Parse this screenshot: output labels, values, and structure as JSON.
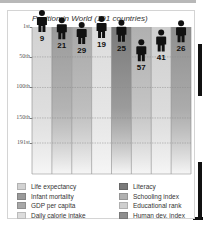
{
  "chart_data": {
    "type": "bar",
    "title": "Position in World (191 countries)",
    "xlabel": "",
    "ylabel": "",
    "y_axis_inverted": true,
    "ylim": [
      1,
      191
    ],
    "yticks": [
      {
        "value": 1,
        "label": "1st"
      },
      {
        "value": 50,
        "label": "50th"
      },
      {
        "value": 100,
        "label": "100th"
      },
      {
        "value": 150,
        "label": "150th"
      },
      {
        "value": 191,
        "label": "191st"
      }
    ],
    "grid": true,
    "legend_placement": "bottom",
    "categories": [
      "Life expectancy",
      "Infant mortality",
      "GDP per capita",
      "Daily calorie intake",
      "Literacy",
      "Schooling index",
      "Educational rank",
      "Human dev. index"
    ],
    "values": [
      9,
      21,
      29,
      19,
      25,
      57,
      41,
      26
    ],
    "colors": [
      "#d2d2d2",
      "#9a9a9a",
      "#a8a8a8",
      "#dcdcdc",
      "#7a7a7a",
      "#b0b0b0",
      "#cfcfcf",
      "#8f8f8f"
    ],
    "marker": "person-icon"
  },
  "legend": {
    "left": [
      "Life expectancy",
      "Infant mortality",
      "GDP per capita",
      "Daily calorie intake"
    ],
    "right": [
      "Literacy",
      "Schooling index",
      "Educational rank",
      "Human dev. index"
    ]
  }
}
